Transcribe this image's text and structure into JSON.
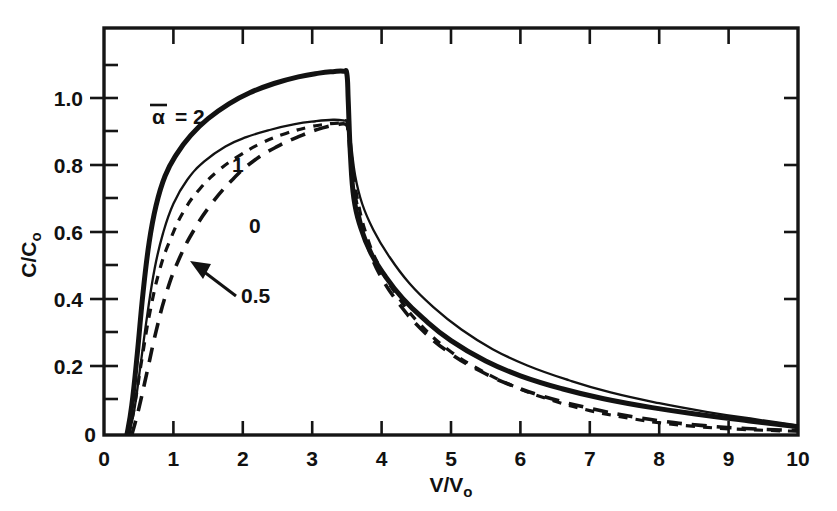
{
  "chart_data": {
    "type": "line",
    "title": "",
    "xlabel": "V/Vo",
    "ylabel": "C/Co",
    "xlim": [
      0,
      10
    ],
    "ylim": [
      0,
      1.1
    ],
    "grid": false,
    "legend_position": "inline-annotations",
    "x_ticks": [
      "0",
      "1",
      "2",
      "3",
      "4",
      "5",
      "6",
      "7",
      "8",
      "9",
      "10"
    ],
    "x_tick_values": [
      0,
      1,
      2,
      3,
      4,
      5,
      6,
      7,
      8,
      9,
      10
    ],
    "y_ticks": [
      "0",
      "0.2",
      "0.4",
      "0.6",
      "0.8",
      "1.0"
    ],
    "y_tick_values": [
      0,
      0.2,
      0.4,
      0.6,
      0.8,
      1.0
    ],
    "series": [
      {
        "name": "alpha-bar = 2",
        "label": "2",
        "style": "thick-solid",
        "x": [
          0.33,
          0.4,
          0.48,
          0.56,
          0.65,
          0.75,
          0.88,
          1.05,
          1.25,
          1.5,
          1.8,
          2.1,
          2.45,
          2.8,
          3.1,
          3.3,
          3.45,
          3.5,
          3.52,
          3.55,
          3.6,
          3.7,
          3.85,
          4.05,
          4.3,
          4.6,
          5.0,
          5.5,
          6.0,
          6.6,
          7.2,
          7.9,
          8.6,
          9.3,
          10.0
        ],
        "y": [
          0.0,
          0.08,
          0.22,
          0.38,
          0.52,
          0.62,
          0.7,
          0.76,
          0.81,
          0.855,
          0.895,
          0.925,
          0.95,
          0.968,
          0.978,
          0.982,
          0.983,
          0.975,
          0.9,
          0.76,
          0.64,
          0.56,
          0.49,
          0.43,
          0.37,
          0.315,
          0.255,
          0.2,
          0.16,
          0.125,
          0.098,
          0.074,
          0.055,
          0.038,
          0.022
        ]
      },
      {
        "name": "alpha-bar = 1",
        "label": "1",
        "style": "thin-solid",
        "x": [
          0.35,
          0.43,
          0.52,
          0.62,
          0.73,
          0.85,
          1.0,
          1.2,
          1.45,
          1.75,
          2.05,
          2.4,
          2.75,
          3.05,
          3.3,
          3.45,
          3.5,
          3.55,
          3.62,
          3.72,
          3.88,
          4.1,
          4.4,
          4.75,
          5.15,
          5.6,
          6.1,
          6.7,
          7.3,
          8.0,
          8.7,
          9.4,
          10.0
        ],
        "y": [
          0.0,
          0.06,
          0.18,
          0.32,
          0.45,
          0.545,
          0.625,
          0.69,
          0.74,
          0.78,
          0.805,
          0.825,
          0.84,
          0.848,
          0.852,
          0.85,
          0.845,
          0.8,
          0.7,
          0.625,
          0.555,
          0.485,
          0.41,
          0.345,
          0.285,
          0.232,
          0.188,
          0.148,
          0.115,
          0.086,
          0.062,
          0.042,
          0.026
        ]
      },
      {
        "name": "alpha-bar = 0.5",
        "label": "0.5",
        "style": "long-dash",
        "x": [
          0.4,
          0.5,
          0.62,
          0.75,
          0.9,
          1.08,
          1.3,
          1.55,
          1.85,
          2.15,
          2.5,
          2.85,
          3.15,
          3.35,
          3.48,
          3.52,
          3.58,
          3.68,
          3.82,
          4.0,
          4.25,
          4.55,
          4.95,
          5.4,
          5.9,
          6.45,
          7.05,
          7.6,
          8.1,
          8.6,
          9.2,
          10.0
        ],
        "y": [
          0.0,
          0.07,
          0.17,
          0.28,
          0.385,
          0.475,
          0.555,
          0.625,
          0.69,
          0.74,
          0.78,
          0.81,
          0.83,
          0.838,
          0.84,
          0.82,
          0.7,
          0.59,
          0.5,
          0.425,
          0.355,
          0.29,
          0.226,
          0.175,
          0.132,
          0.098,
          0.07,
          0.05,
          0.036,
          0.026,
          0.018,
          0.012
        ]
      },
      {
        "name": "alpha-bar = 0",
        "label": "0",
        "style": "short-dash",
        "x": [
          0.36,
          0.45,
          0.55,
          0.66,
          0.8,
          0.96,
          1.15,
          1.38,
          1.65,
          1.95,
          2.28,
          2.62,
          2.95,
          3.2,
          3.4,
          3.5,
          3.56,
          3.65,
          3.8,
          4.0,
          4.25,
          4.55,
          4.95,
          5.4,
          5.9,
          6.45,
          7.0,
          7.55,
          8.05,
          8.6,
          9.2,
          10.0
        ],
        "y": [
          0.0,
          0.09,
          0.21,
          0.33,
          0.445,
          0.53,
          0.605,
          0.665,
          0.715,
          0.755,
          0.79,
          0.815,
          0.832,
          0.84,
          0.843,
          0.838,
          0.76,
          0.64,
          0.53,
          0.445,
          0.37,
          0.3,
          0.232,
          0.178,
          0.132,
          0.094,
          0.066,
          0.046,
          0.032,
          0.022,
          0.015,
          0.01
        ]
      }
    ],
    "annotations": [
      {
        "text": "α = 2",
        "series": "alpha-bar = 2",
        "note": "alpha with overbar, equals two"
      },
      {
        "text": "1",
        "series": "alpha-bar = 1"
      },
      {
        "text": "0",
        "series": "alpha-bar = 0"
      },
      {
        "text": "0.5",
        "series": "alpha-bar = 0.5",
        "has_arrow": true
      }
    ],
    "alpha_symbol": "α",
    "equals_two": "= 2"
  },
  "axes": {
    "x_title_main": "V/V",
    "x_title_sub": "o",
    "y_title_main": "C/C",
    "y_title_sub": "o"
  },
  "colors": {
    "ink": "#121212",
    "background": "#ffffff"
  }
}
